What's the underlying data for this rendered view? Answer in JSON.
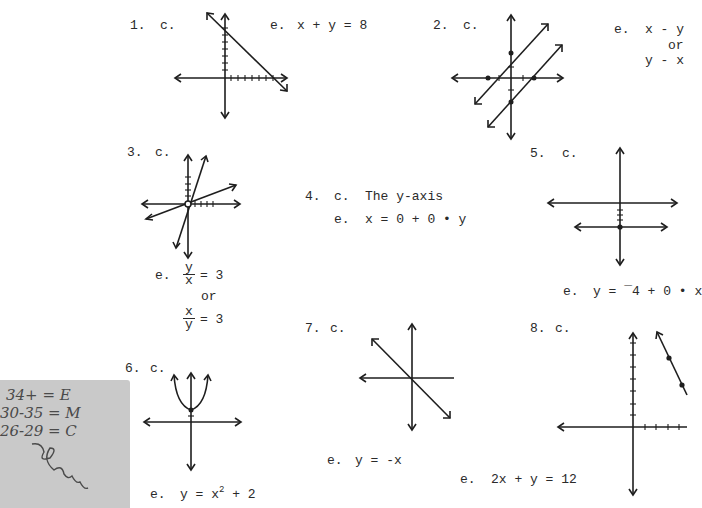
{
  "problems": [
    {
      "number": "1.",
      "c_label": "c.",
      "e_label": "e.",
      "equation": "x + y = 8"
    },
    {
      "number": "2.",
      "c_label": "c.",
      "e_label": "e.",
      "equation_1": "x - y",
      "or": "or",
      "equation_2": "y - x"
    },
    {
      "number": "3.",
      "c_label": "c.",
      "e_label": "e.",
      "frac1_num": "y",
      "frac1_den": "x",
      "eq_rhs": "= 3",
      "or": "or",
      "frac2_num": "x",
      "frac2_den": "y"
    },
    {
      "number": "4.",
      "c_label": "c.",
      "c_text": "The y-axis",
      "e_label": "e.",
      "equation": "x = 0 + 0 • y"
    },
    {
      "number": "5.",
      "c_label": "c.",
      "e_label": "e.",
      "equation": "y = ¯4 + 0 • x"
    },
    {
      "number": "6.",
      "c_label": "c.",
      "e_label": "e.",
      "eq_left": "y = x",
      "eq_exp": "2",
      "eq_right": " + 2"
    },
    {
      "number": "7.",
      "c_label": "c.",
      "e_label": "e.",
      "equation": "y = -x"
    },
    {
      "number": "8.",
      "c_label": "c.",
      "e_label": "e.",
      "equation": "2x + y = 12"
    }
  ],
  "grading_note": {
    "lines": [
      "34+ = E",
      "30-35 = M",
      "26-29 = C"
    ],
    "signature": "ℓɱɱ"
  }
}
